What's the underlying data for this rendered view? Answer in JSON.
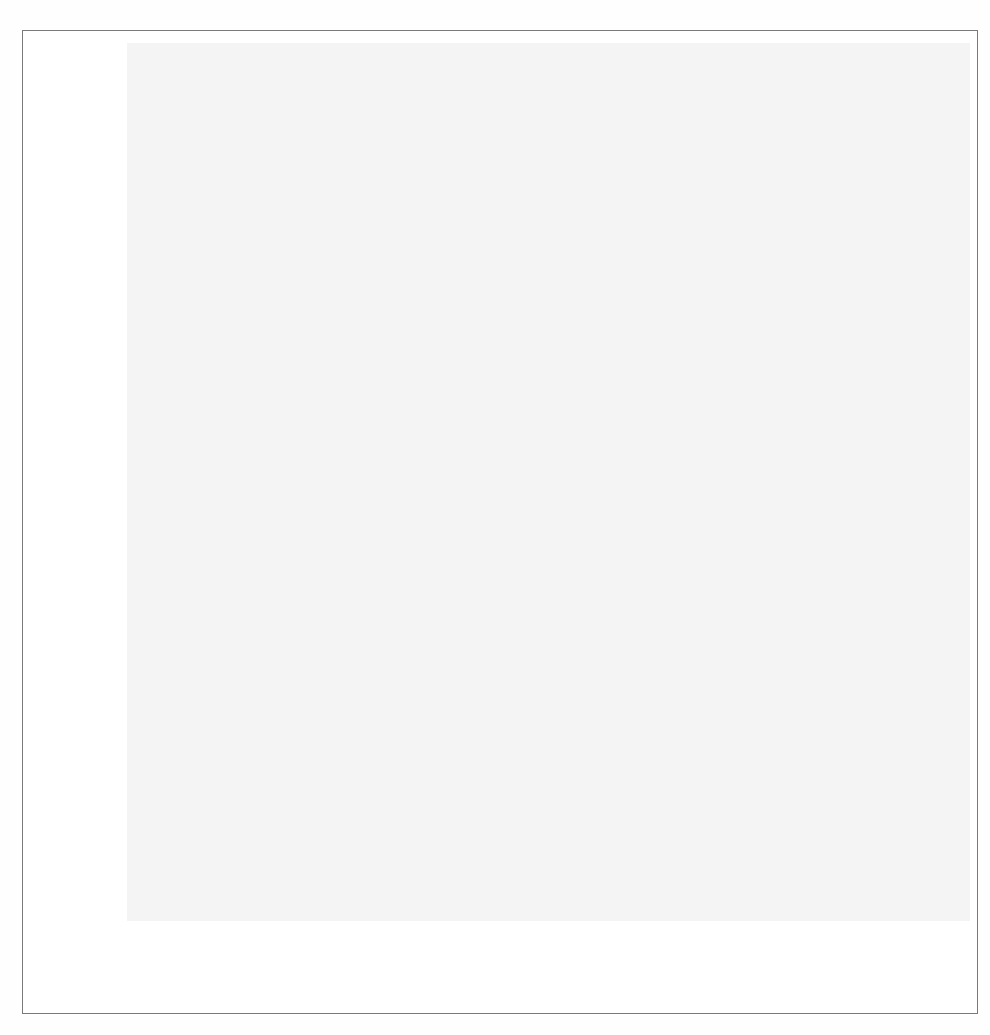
{
  "figure": {
    "caption": "Figure 9.11  Gamma distribution",
    "panel_bg": "#f4f4f4",
    "grid_color": "#ffffff",
    "line_color": "#1a1a1a",
    "tick_text_color": "#9a9a9a",
    "axis_title_color": "#1b1b1b"
  },
  "chart_data": {
    "type": "line",
    "title": "",
    "subtitle": "",
    "xlabel": "x",
    "ylabel": "density",
    "xlim": [
      -300,
      11700
    ],
    "ylim": [
      0,
      0.00086
    ],
    "grid": true,
    "legend": "none",
    "xticks": [
      2000,
      4000,
      6000,
      8000,
      10000
    ],
    "xtick_labels": [
      "2000",
      "4000",
      "6000",
      "8000",
      "10000"
    ],
    "yticks": [
      0,
      0.0002,
      0.0004,
      0.0006,
      0.0008
    ],
    "ytick_labels": [
      "0e+00",
      "2e-04",
      "4e-04",
      "6e-04",
      "8e-04"
    ],
    "series": [
      {
        "name": "density",
        "x": [
          -300,
          0,
          120,
          200,
          280,
          340,
          400,
          470,
          520,
          600,
          700,
          800,
          900,
          1000,
          1100,
          1200,
          1300,
          1400,
          1500,
          1600,
          1700,
          1800,
          1900,
          2000,
          2100,
          2200,
          2300,
          2400,
          2500,
          2600,
          2700,
          2800,
          2900,
          3000,
          3100,
          3200,
          3300,
          3400,
          3500,
          3600,
          3800,
          4000,
          4200,
          4400,
          4500,
          4600,
          4800,
          5000,
          5200,
          5400,
          5600,
          5800,
          6000,
          6400,
          6800,
          7200,
          7600,
          8000,
          8600,
          9200,
          9800,
          10400,
          11000,
          11600
        ],
        "y": [
          0.0,
          0.0,
          0.0003,
          0.0006,
          0.00082,
          0.000845,
          0.00083,
          0.000795,
          0.000765,
          0.00071,
          0.00065,
          0.000592,
          0.00054,
          0.00049,
          0.000444,
          0.000402,
          0.000364,
          0.000329,
          0.000297,
          0.000268,
          0.000242,
          0.000218,
          0.000196,
          0.000177,
          0.000159,
          0.000143,
          0.000129,
          0.000116,
          0.000104,
          9.35e-05,
          8.41e-05,
          7.57e-05,
          6.81e-05,
          6.12e-05,
          5.56e-05,
          5.06e-05,
          4.6e-05,
          4.18e-05,
          3.8e-05,
          3.45e-05,
          2.85e-05,
          2.35e-05,
          1.95e-05,
          1.62e-05,
          1.52e-05,
          1.44e-05,
          1.2e-05,
          9.9e-06,
          8.2e-06,
          6.8e-06,
          5.6e-06,
          4.6e-06,
          3.8e-06,
          2.6e-06,
          1.8e-06,
          1.2e-06,
          8e-07,
          5e-07,
          3e-07,
          1.5e-07,
          8e-08,
          4e-08,
          2e-08,
          0.0
        ]
      }
    ]
  }
}
